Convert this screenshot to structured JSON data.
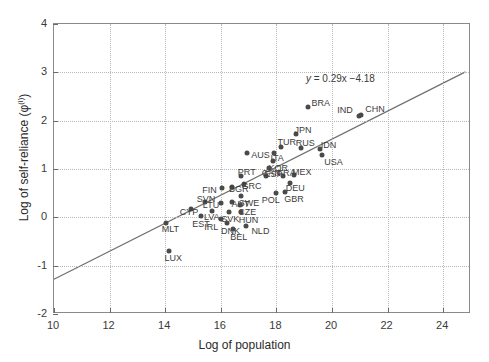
{
  "chart_data": {
    "type": "scatter",
    "title": "",
    "xlabel": "Log of population",
    "ylabel_html": "Log of self-reliance (φ<sup>(i)</sup>)",
    "ylabel": "Log of self-reliance (φ(i))",
    "xlim": [
      10,
      25
    ],
    "ylim": [
      -2,
      4
    ],
    "xticks": [
      10,
      12,
      14,
      16,
      18,
      20,
      22,
      24
    ],
    "yticks": [
      -2,
      -1,
      0,
      1,
      2,
      3,
      4
    ],
    "xtick_labels": [
      "10",
      "12",
      "14",
      "16",
      "18",
      "20",
      "22",
      "24"
    ],
    "ytick_labels": [
      "-2",
      "-1",
      "0",
      "1",
      "2",
      "3",
      "4"
    ],
    "grid": true,
    "grid_style": "dotted",
    "legend": "none",
    "annotation": {
      "text": "y = 0.29x −4.18",
      "lhs": "y",
      "rhs": " = 0.29x −4.18",
      "x": 19.1,
      "y": 2.97
    },
    "fit_line": {
      "slope": 0.29,
      "intercept": -4.18,
      "x_start": 10,
      "x_end": 24.8,
      "y_start": -1.28,
      "y_end": 3.01,
      "color": "#707070"
    },
    "marker_color": "#4a4a4a",
    "points": [
      {
        "label": "CHN",
        "x": 21.05,
        "y": 2.12,
        "lx": 4,
        "ly": -10
      },
      {
        "label": "IND",
        "x": 20.98,
        "y": 2.1,
        "lx": -22,
        "ly": -10
      },
      {
        "label": "BRA",
        "x": 19.12,
        "y": 2.28,
        "lx": 4,
        "ly": -8
      },
      {
        "label": "USA",
        "x": 19.65,
        "y": 1.3,
        "lx": 2,
        "ly": 3
      },
      {
        "label": "IDN",
        "x": 19.56,
        "y": 1.42,
        "lx": 1,
        "ly": -8
      },
      {
        "label": "RUS",
        "x": 18.88,
        "y": 1.44,
        "lx": -5,
        "ly": -9
      },
      {
        "label": "JPN",
        "x": 18.72,
        "y": 1.72,
        "lx": -2,
        "ly": -8
      },
      {
        "label": "TUR",
        "x": 18.18,
        "y": 1.45,
        "lx": -4,
        "ly": -9
      },
      {
        "label": "ITA",
        "x": 17.93,
        "y": 1.33,
        "lx": -4,
        "ly": 1
      },
      {
        "label": "AUS",
        "x": 16.95,
        "y": 1.33,
        "lx": 4,
        "ly": -2
      },
      {
        "label": "KOR",
        "x": 17.86,
        "y": 1.16,
        "lx": -4,
        "ly": 3
      },
      {
        "label": "ESP",
        "x": 17.72,
        "y": 1.02,
        "lx": -4,
        "ly": 2
      },
      {
        "label": "MEX",
        "x": 18.63,
        "y": 0.87,
        "lx": -2,
        "ly": -7
      },
      {
        "label": "FRA",
        "x": 18.22,
        "y": 0.86,
        "lx": -5,
        "ly": -7
      },
      {
        "label": "CAN",
        "x": 17.62,
        "y": 0.85,
        "lx": -4,
        "ly": -7
      },
      {
        "label": "DEU",
        "x": 18.48,
        "y": 0.72,
        "lx": -4,
        "ly": 1
      },
      {
        "label": "GBR",
        "x": 18.32,
        "y": 0.52,
        "lx": -1,
        "ly": 3
      },
      {
        "label": "POL",
        "x": 17.98,
        "y": 0.5,
        "lx": -14,
        "ly": 3
      },
      {
        "label": "PRT",
        "x": 16.72,
        "y": 0.85,
        "lx": -3,
        "ly": -8
      },
      {
        "label": "GRC",
        "x": 16.82,
        "y": 0.7,
        "lx": -2,
        "ly": -2
      },
      {
        "label": "BGR",
        "x": 16.4,
        "y": 0.62,
        "lx": -3,
        "ly": -2
      },
      {
        "label": "FIN",
        "x": 16.05,
        "y": 0.6,
        "lx": -20,
        "ly": -2
      },
      {
        "label": "SWE",
        "x": 16.72,
        "y": 0.44,
        "lx": -2,
        "ly": 3
      },
      {
        "label": "AUT",
        "x": 16.42,
        "y": 0.32,
        "lx": -1,
        "ly": -2
      },
      {
        "label": "CZE",
        "x": 16.7,
        "y": 0.26,
        "lx": -2,
        "ly": 3
      },
      {
        "label": "LTU",
        "x": 16.0,
        "y": 0.3,
        "lx": -18,
        "ly": -2
      },
      {
        "label": "SVN",
        "x": 15.42,
        "y": 0.32,
        "lx": -8,
        "ly": -7
      },
      {
        "label": "HUN",
        "x": 16.72,
        "y": 0.12,
        "lx": -2,
        "ly": 4
      },
      {
        "label": "SVK",
        "x": 16.3,
        "y": 0.12,
        "lx": -8,
        "ly": 3
      },
      {
        "label": "LVA",
        "x": 15.68,
        "y": 0.14,
        "lx": -8,
        "ly": 2
      },
      {
        "label": "CYP",
        "x": 14.92,
        "y": 0.18,
        "lx": -11,
        "ly": -1
      },
      {
        "label": "EST",
        "x": 15.3,
        "y": 0.02,
        "lx": -9,
        "ly": 4
      },
      {
        "label": "IRL",
        "x": 16.02,
        "y": -0.04,
        "lx": -17,
        "ly": 4
      },
      {
        "label": "DNK",
        "x": 16.22,
        "y": -0.12,
        "lx": -6,
        "ly": 4
      },
      {
        "label": "BEL",
        "x": 16.45,
        "y": -0.24,
        "lx": -3,
        "ly": 4
      },
      {
        "label": "NLD",
        "x": 16.92,
        "y": -0.18,
        "lx": 5,
        "ly": 1
      },
      {
        "label": "MLT",
        "x": 14.02,
        "y": -0.12,
        "lx": -4,
        "ly": 2
      },
      {
        "label": "LUX",
        "x": 14.12,
        "y": -0.7,
        "lx": -4,
        "ly": 3
      }
    ]
  }
}
